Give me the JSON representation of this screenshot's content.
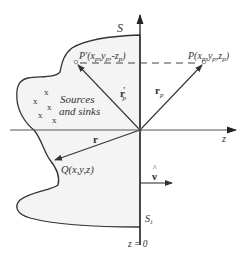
{
  "labels": {
    "surface_s": "S",
    "surface_s1": "S",
    "surface_s1_sub": "1",
    "point_p_prime": "P'(x",
    "point_p_prime_sub1": "p",
    "point_p_prime_mid": ",y",
    "point_p_prime_sub2": "p",
    "point_p_prime_mid2": ",-z",
    "point_p_prime_sub3": "p",
    "point_p_prime_end": ")",
    "point_p": "P(x",
    "point_p_sub1": "p",
    "point_p_mid": ",y",
    "point_p_sub2": "p",
    "point_p_mid2": ",z",
    "point_p_sub3": "p",
    "point_p_end": ")",
    "vector_rp_prime": "r",
    "vector_rp_prime_mark": "'",
    "vector_rp_prime_sub": "p",
    "vector_rp": "r",
    "vector_rp_sub": "p",
    "vector_r": "r",
    "point_q": "Q(x,y,z)",
    "region_text_line1": "Sources",
    "region_text_line2": "and sinks",
    "axis_z": "z",
    "plane_z0": "z = 0",
    "normal_nu": "ν",
    "normal_hat": "^",
    "source_marker": "x"
  },
  "colors": {
    "line": "#333333",
    "region_fill": "#f4f4f4",
    "text": "#333333"
  }
}
